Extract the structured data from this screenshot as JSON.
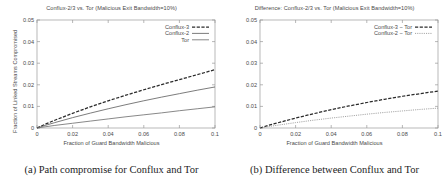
{
  "figure": {
    "panels": [
      {
        "id": "panel-a",
        "caption": "(a) Path compromise for Conflux and Tor",
        "chart_data": {
          "type": "line",
          "title": "Conflux-2/3 vs. Tor (Malicious Exit Bandwidth=10%)",
          "xlabel": "Fraction of Guard Bandwidth Malicious",
          "ylabel": "Fraction of Linked Streams Compromised",
          "xlim": [
            0,
            0.1
          ],
          "ylim": [
            0,
            0.05
          ],
          "xticks": [
            0,
            0.02,
            0.04,
            0.06,
            0.08,
            0.1
          ],
          "xticklabels": [
            "0",
            "0.02",
            "0.04",
            "0.06",
            "0.08",
            "0.1"
          ],
          "yticks": [
            0,
            0.01,
            0.02,
            0.03,
            0.04,
            0.05
          ],
          "yticklabels": [
            "0",
            "0.01",
            "0.02",
            "0.03",
            "0.04",
            "0.05"
          ],
          "grid": false,
          "legend_position": "top-right",
          "x": [
            0,
            0.005,
            0.01,
            0.02,
            0.03,
            0.04,
            0.05,
            0.06,
            0.07,
            0.08,
            0.09,
            0.1
          ],
          "series": [
            {
              "name": "Conflux-3",
              "style": "dashed",
              "color": "#2b2b2b",
              "values": [
                0,
                0.0019,
                0.0036,
                0.0068,
                0.0098,
                0.0126,
                0.0152,
                0.0177,
                0.0201,
                0.0224,
                0.0247,
                0.027
              ]
            },
            {
              "name": "Conflux-2",
              "style": "solid",
              "color": "#5a5a5a",
              "values": [
                0,
                0.0013,
                0.0025,
                0.0048,
                0.0069,
                0.0089,
                0.0108,
                0.0126,
                0.0143,
                0.0159,
                0.0175,
                0.019
              ]
            },
            {
              "name": "Tor",
              "style": "solid",
              "color": "#6a6a6a",
              "values": [
                0,
                0.0006,
                0.0012,
                0.0022,
                0.0032,
                0.0042,
                0.0052,
                0.0061,
                0.007,
                0.008,
                0.0089,
                0.0098
              ]
            }
          ]
        }
      },
      {
        "id": "panel-b",
        "caption": "(b) Difference between Conflux and Tor",
        "chart_data": {
          "type": "line",
          "title": "Difference: Conflux-2/3 vs. Tor (Malicious Exit Bandwidth=10%)",
          "xlabel": "Fraction of Guard Bandwidth Malicious",
          "ylabel": "Absolute Increased Compromise over Tor",
          "xlim": [
            0,
            0.1
          ],
          "ylim": [
            0,
            0.05
          ],
          "xticks": [
            0,
            0.02,
            0.04,
            0.06,
            0.08,
            0.1
          ],
          "xticklabels": [
            "0",
            "0.02",
            "0.04",
            "0.06",
            "0.08",
            "0.1"
          ],
          "yticks": [
            0,
            0.01,
            0.02,
            0.03,
            0.04,
            0.05
          ],
          "yticklabels": [
            "0",
            "0.01",
            "0.02",
            "0.03",
            "0.04",
            "0.05"
          ],
          "grid": false,
          "legend_position": "top-right",
          "x": [
            0,
            0.005,
            0.01,
            0.02,
            0.03,
            0.04,
            0.05,
            0.06,
            0.07,
            0.08,
            0.09,
            0.1
          ],
          "series": [
            {
              "name": "Conflux-3 − Tor",
              "style": "dashed",
              "color": "#2b2b2b",
              "values": [
                0,
                0.0013,
                0.0024,
                0.0046,
                0.0066,
                0.0085,
                0.0102,
                0.0118,
                0.0133,
                0.0147,
                0.0159,
                0.0171
              ]
            },
            {
              "name": "Conflux-2 − Tor",
              "style": "dotted",
              "color": "#8a8a8a",
              "values": [
                0,
                0.0007,
                0.0013,
                0.0025,
                0.0036,
                0.0046,
                0.0055,
                0.0064,
                0.0072,
                0.0079,
                0.0086,
                0.0092
              ]
            }
          ]
        }
      }
    ]
  }
}
